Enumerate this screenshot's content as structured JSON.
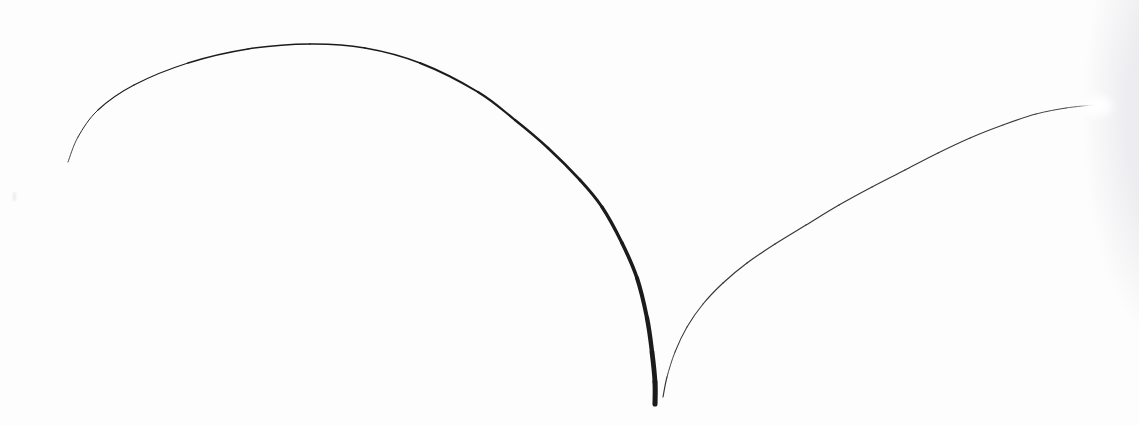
{
  "canvas": {
    "width": 1139,
    "height": 425,
    "background": "#fdfdfd",
    "alt": "Freehand pen sketch on white paper: a large arch stroke thickening toward a heavy vertical end at bottom center, and a second thin curve rising from bottom center to the upper right edge"
  },
  "sketch": {
    "strokes": [
      {
        "name": "left-arch-stroke",
        "color": "#1b1b1b",
        "points": [
          [
            68,
            162,
            0.7
          ],
          [
            78,
            137,
            0.9
          ],
          [
            98,
            110,
            1.0
          ],
          [
            134,
            85,
            1.2
          ],
          [
            188,
            63,
            1.3
          ],
          [
            248,
            49,
            1.4
          ],
          [
            310,
            44,
            1.5
          ],
          [
            365,
            48,
            1.6
          ],
          [
            420,
            63,
            1.8
          ],
          [
            478,
            92,
            2.1
          ],
          [
            515,
            120,
            2.3
          ],
          [
            548,
            148,
            2.5
          ],
          [
            580,
            180,
            2.8
          ],
          [
            602,
            207,
            3.1
          ],
          [
            622,
            243,
            3.4
          ],
          [
            637,
            278,
            3.8
          ],
          [
            647,
            318,
            4.2
          ],
          [
            652,
            352,
            4.6
          ],
          [
            655,
            382,
            5.0
          ],
          [
            655,
            404,
            5.2
          ]
        ]
      },
      {
        "name": "right-rising-stroke",
        "color": "#383838",
        "points": [
          [
            663,
            397,
            1.4
          ],
          [
            667,
            377,
            0.9
          ],
          [
            675,
            352,
            1.0
          ],
          [
            687,
            327,
            1.1
          ],
          [
            703,
            304,
            1.1
          ],
          [
            723,
            283,
            1.2
          ],
          [
            747,
            263,
            1.2
          ],
          [
            775,
            244,
            1.2
          ],
          [
            806,
            225,
            1.2
          ],
          [
            839,
            205,
            1.2
          ],
          [
            872,
            187,
            1.2
          ],
          [
            905,
            170,
            1.2
          ],
          [
            938,
            153,
            1.2
          ],
          [
            970,
            138,
            1.1
          ],
          [
            1003,
            125,
            1.1
          ],
          [
            1036,
            114,
            1.0
          ],
          [
            1066,
            108,
            0.9
          ],
          [
            1093,
            105,
            0.7
          ]
        ]
      }
    ]
  },
  "artifacts": {
    "edge_shadow": {
      "position": "right",
      "color": "#e9e9ed",
      "center_x": 1172,
      "center_y": 115,
      "radius_x": 115,
      "radius_y": 300
    },
    "fade_spot": {
      "x": 1097,
      "y": 106,
      "width": 30,
      "height": 20,
      "color": "#ffffff"
    },
    "paper_speck": {
      "x": 13,
      "y": 192,
      "width": 3,
      "height": 9,
      "color": "#e6e6e6"
    }
  }
}
